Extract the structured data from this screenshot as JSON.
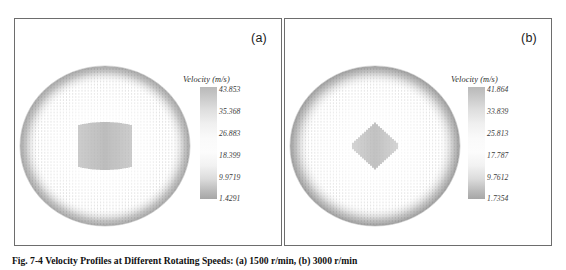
{
  "figure": {
    "caption": "Fig. 7-4 Velocity Profiles at Different Rotating Speeds: (a) 1500 r/min, (b) 3000 r/min"
  },
  "panels": [
    {
      "tag": "(a)",
      "legend": {
        "title": "Velocity (m/s)",
        "ticks": [
          "43.853",
          "35.368",
          "26.883",
          "18.399",
          "9.9719",
          "1.4291"
        ],
        "max": 43.853,
        "min": 1.4291
      },
      "field": {
        "shape": "ellipse",
        "core": "rectangular-band",
        "core_width": 0.3,
        "core_height": 0.26
      }
    },
    {
      "tag": "(b)",
      "legend": {
        "title": "Velocity (m/s)",
        "ticks": [
          "41.864",
          "33.839",
          "25.813",
          "17.787",
          "9.7612",
          "1.7354"
        ],
        "max": 41.864,
        "min": 1.7354
      },
      "field": {
        "shape": "ellipse",
        "core": "diamond",
        "core_width": 0.26,
        "core_height": 0.22
      }
    }
  ],
  "chart_data": {
    "type": "heatmap",
    "title": "Velocity Profiles",
    "subtitle": "",
    "xlabel": "",
    "ylabel": "",
    "legend_position": "right",
    "grid": false,
    "panels": [
      {
        "name": "(a)",
        "colorbar_label": "Velocity (m/s)",
        "colorbar_ticks": [
          43.853,
          35.368,
          26.883,
          18.399,
          9.9719,
          1.4291
        ],
        "vmin": 1.4291,
        "vmax": 43.853,
        "domain": "ellipse",
        "peak_region": "central rectangular band of high-velocity vectors"
      },
      {
        "name": "(b)",
        "colorbar_label": "Velocity (m/s)",
        "colorbar_ticks": [
          41.864,
          33.839,
          25.813,
          17.787,
          9.7612,
          1.7354
        ],
        "vmin": 1.7354,
        "vmax": 41.864,
        "domain": "ellipse",
        "peak_region": "central diamond-shaped cluster of high-velocity vectors"
      }
    ]
  }
}
